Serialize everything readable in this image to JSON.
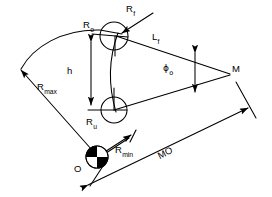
{
  "diagram": {
    "type": "technical-line-diagram",
    "background_color": "#ffffff",
    "line_color": "#000000",
    "labels": {
      "r_o": {
        "base": "R",
        "sub": "o",
        "text": "Ro"
      },
      "r_f": {
        "base": "R",
        "sub": "f",
        "text": "Rf"
      },
      "r_u": {
        "base": "R",
        "sub": "u",
        "text": "Ru"
      },
      "r_max": {
        "base": "R",
        "sub": "max",
        "text": "Rmax"
      },
      "r_min": {
        "base": "R",
        "sub": "min",
        "text": "Rmin"
      },
      "l_f": {
        "base": "L",
        "sub": "f",
        "text": "Lf"
      },
      "phi_o": {
        "base": "ϕ",
        "sub": "o",
        "text": "ϕo"
      },
      "h": {
        "base": "h",
        "sub": "",
        "text": "h"
      },
      "mo": {
        "base": "MO",
        "sub": "",
        "text": "MO"
      },
      "point_m": {
        "base": "M",
        "sub": "",
        "text": "M"
      },
      "point_o": {
        "base": "O",
        "sub": "",
        "text": "O"
      }
    },
    "nodes": {
      "upper_circle": {
        "cx": 114,
        "cy": 36,
        "r": 14
      },
      "lower_circle": {
        "cx": 114,
        "cy": 110,
        "r": 13
      },
      "pivot_marker": {
        "cx": 97,
        "cy": 157,
        "r": 11,
        "style": "quartered-circle"
      },
      "vertex_m": {
        "x": 231,
        "y": 74
      }
    }
  }
}
